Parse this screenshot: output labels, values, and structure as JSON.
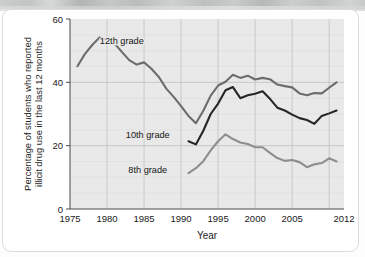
{
  "figure": {
    "card_label": "drug-use-trend-figure",
    "scan_artifact": "scan-edge-band"
  },
  "chart_data": {
    "type": "line",
    "title": "",
    "xlabel": "Year",
    "ylabel": "Percentage of students who reported illicit drug use in the last 12 months",
    "ylabel_line1": "Percentage of students who reported",
    "ylabel_line2": "illicit drug use in the last 12 months",
    "xlim": [
      1975,
      2012
    ],
    "ylim": [
      0,
      60
    ],
    "yticks": [
      0,
      20,
      40,
      60
    ],
    "ytick_labels": [
      "0",
      "20",
      "40",
      "60"
    ],
    "xticks": [
      1975,
      1980,
      1985,
      1990,
      1995,
      2000,
      2005,
      2012
    ],
    "xtick_labels": [
      "1975",
      "1980",
      "1985",
      "1990",
      "1995",
      "2000",
      "2005",
      "2012"
    ],
    "grid": "horizontal minor every 5, vertical every 5 years",
    "legend_position": "inline annotations",
    "plot_background": "#e9e9e9",
    "series": [
      {
        "name": "12th grade",
        "color": "#6c6c6c",
        "label_x": 1982.0,
        "label_y": 52.0,
        "x": [
          1976,
          1977,
          1978,
          1979,
          1980,
          1981,
          1982,
          1983,
          1984,
          1985,
          1986,
          1987,
          1988,
          1989,
          1990,
          1991,
          1992,
          1993,
          1994,
          1995,
          1996,
          1997,
          1998,
          1999,
          2000,
          2001,
          2002,
          2003,
          2004,
          2005,
          2006,
          2007,
          2008,
          2009,
          2010,
          2011
        ],
        "y": [
          45.1,
          48.9,
          51.8,
          54.2,
          53.4,
          52.3,
          49.6,
          47.0,
          45.6,
          46.3,
          44.3,
          41.7,
          38.0,
          35.4,
          32.5,
          29.4,
          27.1,
          31.0,
          35.8,
          39.0,
          40.2,
          42.4,
          41.4,
          42.1,
          40.9,
          41.4,
          41.0,
          39.3,
          38.8,
          38.4,
          36.5,
          35.9,
          36.6,
          36.5,
          38.3,
          40.0
        ]
      },
      {
        "name": "10th grade",
        "color": "#262626",
        "label_x": 1985.5,
        "label_y": 22.5,
        "x": [
          1991,
          1992,
          1993,
          1994,
          1995,
          1996,
          1997,
          1998,
          1999,
          2000,
          2001,
          2002,
          2003,
          2004,
          2005,
          2006,
          2007,
          2008,
          2009,
          2010,
          2011
        ],
        "y": [
          21.4,
          20.4,
          24.7,
          30.0,
          33.3,
          37.5,
          38.5,
          35.0,
          35.9,
          36.4,
          37.2,
          34.8,
          32.0,
          31.1,
          29.8,
          28.7,
          28.1,
          26.9,
          29.4,
          30.2,
          31.1
        ]
      },
      {
        "name": "8th grade",
        "color": "#8e8e8e",
        "label_x": 1985.5,
        "label_y": 11.5,
        "x": [
          1991,
          1992,
          1993,
          1994,
          1995,
          1996,
          1997,
          1998,
          1999,
          2000,
          2001,
          2002,
          2003,
          2004,
          2005,
          2006,
          2007,
          2008,
          2009,
          2010,
          2011
        ],
        "y": [
          11.3,
          12.9,
          15.1,
          18.5,
          21.4,
          23.6,
          22.1,
          21.0,
          20.5,
          19.5,
          19.5,
          17.7,
          16.1,
          15.2,
          15.5,
          14.8,
          13.2,
          14.1,
          14.5,
          16.0,
          15.0
        ]
      }
    ]
  }
}
